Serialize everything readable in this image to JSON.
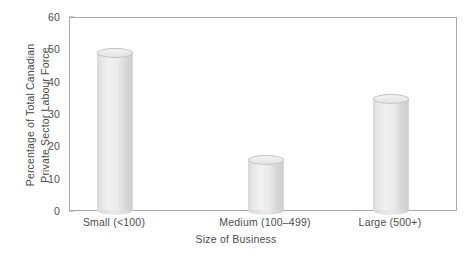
{
  "chart_data": {
    "type": "bar",
    "title": "",
    "subtitle": "",
    "xlabel": "Size of Business",
    "ylabel": "Percentage of Total Canadian Private Sector Labour Force",
    "ylabel_lines": [
      "Percentage of Total Canadian",
      "Private Sector Labour Force"
    ],
    "categories": [
      "Small (<100)",
      "Medium (100–499)",
      "Large (500+)"
    ],
    "values": [
      50,
      17,
      36
    ],
    "ylim": [
      0,
      60
    ],
    "ytick_labels": [
      "0",
      "10",
      "20",
      "30",
      "40",
      "50",
      "60"
    ],
    "ytick_values": [
      0,
      10,
      20,
      30,
      40,
      50,
      60
    ],
    "grid": false,
    "legend": "none",
    "bar_style": "3d-cylinder",
    "colors": {
      "bar_light": "#f2f2f2",
      "bar_mid": "#e0e0e0",
      "bar_dark": "#cfcfcf",
      "axis": "#a8a8a8",
      "text": "#4d4d4d",
      "background": "#ffffff"
    }
  }
}
